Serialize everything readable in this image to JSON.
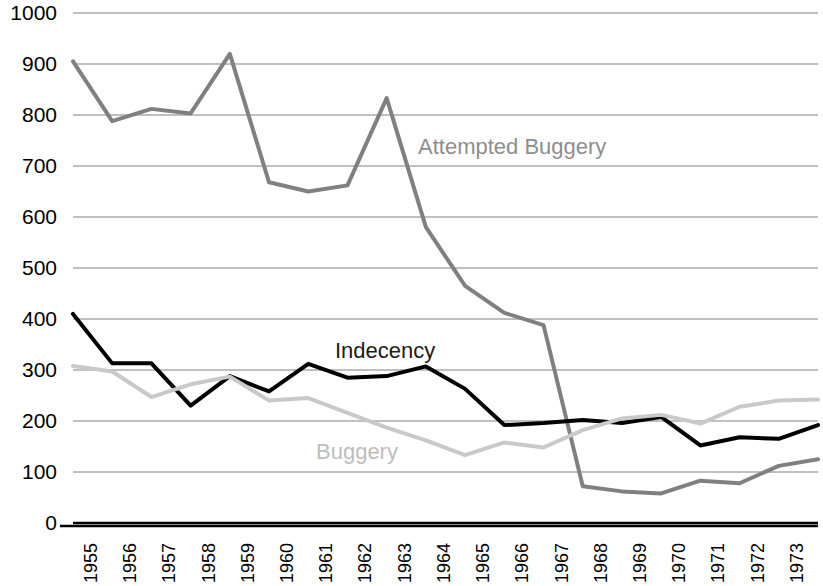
{
  "chart_data": {
    "type": "line",
    "title": "",
    "subtitle": "",
    "xlabel": "",
    "ylabel": "",
    "x": [
      1955,
      1956,
      1957,
      1958,
      1959,
      1960,
      1961,
      1962,
      1963,
      1964,
      1965,
      1966,
      1967,
      1968,
      1969,
      1970,
      1971,
      1972,
      1973,
      1974
    ],
    "categories": [
      "1955",
      "1956",
      "1957",
      "1958",
      "1959",
      "1960",
      "1961",
      "1962",
      "1963",
      "1964",
      "1965",
      "1966",
      "1967",
      "1968",
      "1969",
      "1970",
      "1971",
      "1972",
      "1973",
      "1974"
    ],
    "xlim": [
      1955,
      1974
    ],
    "ylim": [
      0,
      1000
    ],
    "yticks": [
      0,
      100,
      200,
      300,
      400,
      500,
      600,
      700,
      800,
      900,
      1000
    ],
    "ytick_labels": [
      "0",
      "100",
      "200",
      "300",
      "400",
      "500",
      "600",
      "700",
      "800",
      "900",
      "1000"
    ],
    "grid": "horizontal",
    "legend_position": "inline-annotations",
    "series": [
      {
        "name": "Attempted Buggery",
        "color": "#808080",
        "width": 4,
        "values": [
          905,
          788,
          812,
          803,
          920,
          668,
          650,
          662,
          833,
          580,
          465,
          412,
          388,
          72,
          62,
          58,
          83,
          78,
          112,
          125
        ]
      },
      {
        "name": "Indecency",
        "color": "#000000",
        "width": 4,
        "values": [
          410,
          313,
          313,
          230,
          288,
          258,
          312,
          285,
          288,
          307,
          263,
          192,
          196,
          202,
          196,
          208,
          152,
          168,
          165,
          192
        ]
      },
      {
        "name": "Buggery",
        "color": "#c9c9c9",
        "width": 4,
        "values": [
          308,
          297,
          247,
          272,
          287,
          240,
          245,
          216,
          187,
          162,
          133,
          158,
          148,
          182,
          205,
          212,
          195,
          228,
          240,
          242
        ]
      }
    ],
    "annotations": [
      {
        "text": "Attempted Buggery",
        "x_px": 418,
        "y_px": 136,
        "color": "#8e8e8e",
        "series": "Attempted Buggery"
      },
      {
        "text": "Indecency",
        "x_px": 335,
        "y_px": 340,
        "color": "#1a1a1a",
        "series": "Indecency"
      },
      {
        "text": "Buggery",
        "x_px": 316,
        "y_px": 441,
        "color": "#bdbdbd",
        "series": "Buggery"
      }
    ]
  },
  "axes": {
    "y_labels": [
      "1000",
      "900",
      "800",
      "700",
      "600",
      "500",
      "400",
      "300",
      "200",
      "100",
      "0"
    ],
    "x_labels": [
      "1955",
      "1956",
      "1957",
      "1958",
      "1959",
      "1960",
      "1961",
      "1962",
      "1963",
      "1964",
      "1965",
      "1966",
      "1967",
      "1968",
      "1969",
      "1970",
      "1971",
      "1972",
      "1973",
      "1974"
    ]
  },
  "style": {
    "background": "#ffffff",
    "grid_color": "#808080",
    "axis_color": "#000000"
  }
}
